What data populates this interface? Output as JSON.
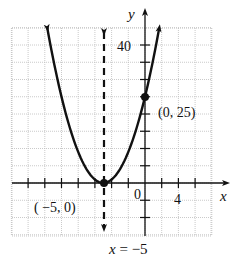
{
  "chart_data": {
    "type": "line",
    "title": "",
    "function": "y = (x + 5)^2",
    "xlabel": "x",
    "ylabel": "y",
    "xlim": [
      -16,
      8
    ],
    "ylim": [
      -15,
      45
    ],
    "x_tick_step": 2,
    "y_tick_step": 5,
    "x_tick_labels": [
      {
        "value": 0,
        "text": "0"
      },
      {
        "value": 4,
        "text": "4"
      }
    ],
    "y_tick_labels": [
      {
        "value": 40,
        "text": "40"
      }
    ],
    "grid": true,
    "series": [
      {
        "name": "parabola",
        "style": "solid",
        "x": [
          -11.7,
          -10,
          -9,
          -8,
          -7,
          -6,
          -5,
          -4,
          -3,
          -2,
          -1,
          0,
          1,
          1.7
        ],
        "y": [
          44.9,
          25,
          16,
          9,
          4,
          1,
          0,
          1,
          4,
          9,
          16,
          25,
          36,
          44.9
        ]
      }
    ],
    "points": [
      {
        "x": -5,
        "y": 0,
        "label": "( −5, 0)"
      },
      {
        "x": 0,
        "y": 25,
        "label": "(0, 25)"
      }
    ],
    "axis_of_symmetry": {
      "x": -5,
      "style": "dashed",
      "label": "x = −5"
    }
  },
  "labels": {
    "x_axis": "x",
    "y_axis": "y",
    "y_tick_40": "40",
    "origin": "0",
    "x_tick_4": "4",
    "vertex": "( −5, 0)",
    "y_intercept": "(0, 25)",
    "axis_eq": "x = −5"
  },
  "colors": {
    "curve": "#111111",
    "grid": "#bdbdbd",
    "axis": "#111111"
  }
}
